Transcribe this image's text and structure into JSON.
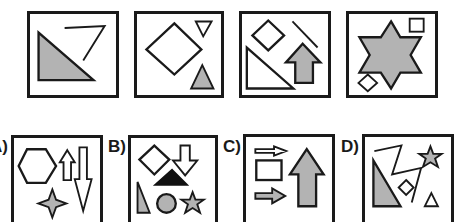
{
  "colors": {
    "stroke": "#1a1a1a",
    "fill_gray": "#b3b3b3",
    "fill_black": "#111111",
    "background": "#ffffff"
  },
  "sequence": [
    {
      "index": 1,
      "shapes": [
        "zigzag-line",
        "right-triangle-gray"
      ]
    },
    {
      "index": 2,
      "shapes": [
        "diamond-large",
        "inverted-triangle",
        "triangle-gray"
      ]
    },
    {
      "index": 3,
      "shapes": [
        "diamond",
        "diagonal-line",
        "right-triangle",
        "up-arrow-gray"
      ]
    },
    {
      "index": 4,
      "shapes": [
        "six-point-star-gray",
        "square",
        "diamond-small"
      ]
    }
  ],
  "options": [
    {
      "label": "A)",
      "shapes": [
        "hexagon",
        "up-arrow-small",
        "down-arrow-long",
        "four-point-star-gray"
      ]
    },
    {
      "label": "B)",
      "shapes": [
        "diamond",
        "down-arrow",
        "triangle-black",
        "right-triangle-gray",
        "circle-gray",
        "star-gray"
      ]
    },
    {
      "label": "C)",
      "shapes": [
        "right-arrow",
        "rectangle",
        "right-arrow-gray",
        "up-arrow-large-gray"
      ]
    },
    {
      "label": "D)",
      "shapes": [
        "zigzag-line",
        "star-gray",
        "right-triangle-gray",
        "diamond-small",
        "triangle"
      ]
    }
  ]
}
